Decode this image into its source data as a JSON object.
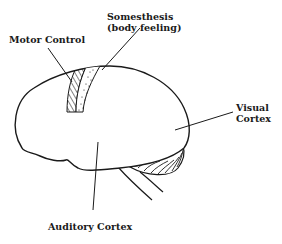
{
  "diagram": {
    "labels": {
      "somesthesis": {
        "line1": "Somesthesis",
        "line2": "(body feeling)"
      },
      "motor": {
        "line1": "Motor Control"
      },
      "visual": {
        "line1": "Visual",
        "line2": "Cortex"
      },
      "auditory": {
        "line1": "Auditory Cortex"
      }
    },
    "colors": {
      "ink": "#1a1a1a",
      "background": "#ffffff"
    }
  }
}
